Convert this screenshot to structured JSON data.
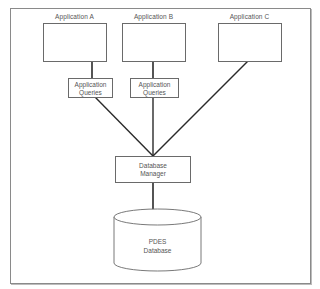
{
  "diagram": {
    "title": "",
    "applications": [
      {
        "label": "Application A"
      },
      {
        "label": "Application B"
      },
      {
        "label": "Application C"
      }
    ],
    "queries": [
      {
        "line1": "Application",
        "line2": "Queries"
      },
      {
        "line1": "Application",
        "line2": "Queries"
      }
    ],
    "manager": {
      "line1": "Database",
      "line2": "Manager"
    },
    "database": {
      "line1": "PDES",
      "line2": "Database"
    },
    "colors": {
      "line": "#2a2a2a",
      "border": "#6a6a6a",
      "text": "#555555",
      "frame": "#8a8a8a"
    }
  }
}
